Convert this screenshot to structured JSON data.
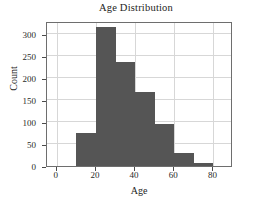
{
  "chart_data": {
    "type": "bar",
    "title": "Age Distribution",
    "xlabel": "Age",
    "ylabel": "Count",
    "grid": true,
    "legend": null,
    "bin_width": 10,
    "xlim": [
      -5,
      90
    ],
    "ylim": [
      0,
      330
    ],
    "xticks": [
      0,
      20,
      40,
      60,
      80
    ],
    "yticks": [
      0,
      50,
      100,
      150,
      200,
      250,
      300
    ],
    "categories": [
      "10-20",
      "20-30",
      "30-40",
      "40-50",
      "50-60",
      "60-70",
      "70-80"
    ],
    "bin_starts": [
      10,
      20,
      30,
      40,
      50,
      60,
      70
    ],
    "values": [
      76,
      317,
      237,
      168,
      96,
      29,
      6
    ],
    "bar_color": "#555555",
    "grid_color": "#d7d7d7",
    "axis_color": "#6e6e6e"
  },
  "figure": {
    "background": "#ffffff"
  }
}
